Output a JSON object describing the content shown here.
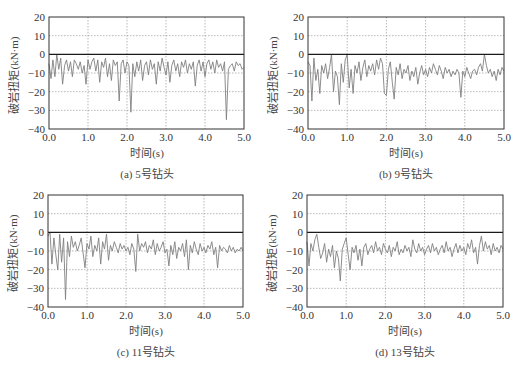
{
  "figure": {
    "caption": ""
  },
  "chart_data": [
    {
      "id": "a",
      "type": "line",
      "caption": "(a) 5号钻头",
      "xlabel": "时间(s)",
      "ylabel": "破岩扭矩(kN·m)",
      "xlim": [
        0.0,
        5.0
      ],
      "ylim": [
        -40,
        20
      ],
      "xticks": [
        "0.0",
        "1.0",
        "2.0",
        "3.0",
        "4.0",
        "5.0"
      ],
      "yticks": [
        "20",
        "10",
        "0",
        "-10",
        "-20",
        "-30",
        "-40"
      ],
      "grid": true,
      "zero_line": true,
      "line_color": "#808080",
      "frame": {
        "left": 49,
        "top": 17,
        "right": 244,
        "bottom": 129
      },
      "x": [
        0.0,
        0.05,
        0.1,
        0.15,
        0.2,
        0.25,
        0.3,
        0.35,
        0.4,
        0.45,
        0.5,
        0.55,
        0.6,
        0.65,
        0.7,
        0.75,
        0.8,
        0.85,
        0.9,
        0.95,
        1.0,
        1.05,
        1.1,
        1.15,
        1.2,
        1.25,
        1.3,
        1.35,
        1.4,
        1.45,
        1.5,
        1.55,
        1.6,
        1.65,
        1.7,
        1.75,
        1.8,
        1.85,
        1.9,
        1.95,
        2.0,
        2.05,
        2.1,
        2.15,
        2.2,
        2.25,
        2.3,
        2.35,
        2.4,
        2.45,
        2.5,
        2.55,
        2.6,
        2.65,
        2.7,
        2.75,
        2.8,
        2.85,
        2.9,
        2.95,
        3.0,
        3.05,
        3.1,
        3.15,
        3.2,
        3.25,
        3.3,
        3.35,
        3.4,
        3.45,
        3.5,
        3.55,
        3.6,
        3.65,
        3.7,
        3.75,
        3.8,
        3.85,
        3.9,
        3.95,
        4.0,
        4.05,
        4.1,
        4.15,
        4.2,
        4.25,
        4.3,
        4.35,
        4.4,
        4.45,
        4.5,
        4.55,
        4.6,
        4.65,
        4.7,
        4.75,
        4.8,
        4.85,
        4.9,
        4.95,
        5.0
      ],
      "values": [
        -5,
        -13,
        -3,
        -12,
        0,
        -8,
        -2,
        -16,
        -6,
        -3,
        -9,
        -4,
        -12,
        -3,
        -5,
        -8,
        -4,
        -10,
        -6,
        -16,
        -3,
        -8,
        -4,
        -2,
        -9,
        -3,
        -15,
        -4,
        -7,
        -2,
        -12,
        -5,
        -14,
        -3,
        -6,
        -4,
        -25,
        -5,
        -3,
        -10,
        -4,
        -6,
        -31,
        -5,
        -12,
        -4,
        -9,
        -3,
        -14,
        -6,
        -4,
        -11,
        -3,
        -8,
        -5,
        -16,
        -4,
        -9,
        -2,
        -7,
        -11,
        -4,
        -15,
        -6,
        -3,
        -9,
        -5,
        -12,
        -4,
        -7,
        -3,
        -10,
        -5,
        -8,
        -4,
        -17,
        -6,
        -3,
        -9,
        -4,
        -12,
        -5,
        -3,
        -8,
        -4,
        -10,
        -3,
        -7,
        -5,
        -9,
        -4,
        -35,
        -8,
        -6,
        -5,
        -9,
        -4,
        -6,
        -5,
        -8,
        -7
      ]
    },
    {
      "id": "b",
      "type": "line",
      "caption": "(b) 9号钻头",
      "xlabel": "时间(s)",
      "ylabel": "破岩扭矩(kN·m)",
      "xlim": [
        0.0,
        5.0
      ],
      "ylim": [
        -40,
        20
      ],
      "xticks": [
        "0.0",
        "1.0",
        "2.0",
        "3.0",
        "4.0",
        "5.0"
      ],
      "yticks": [
        "20",
        "10",
        "0",
        "-10",
        "-20",
        "-30",
        "-40"
      ],
      "grid": true,
      "zero_line": true,
      "line_color": "#808080",
      "frame": {
        "left": 308,
        "top": 17,
        "right": 504,
        "bottom": 129
      },
      "x": [
        0.0,
        0.05,
        0.1,
        0.15,
        0.2,
        0.25,
        0.3,
        0.35,
        0.4,
        0.45,
        0.5,
        0.55,
        0.6,
        0.65,
        0.7,
        0.75,
        0.8,
        0.85,
        0.9,
        0.95,
        1.0,
        1.05,
        1.1,
        1.15,
        1.2,
        1.25,
        1.3,
        1.35,
        1.4,
        1.45,
        1.5,
        1.55,
        1.6,
        1.65,
        1.7,
        1.75,
        1.8,
        1.85,
        1.9,
        1.95,
        2.0,
        2.05,
        2.1,
        2.15,
        2.2,
        2.25,
        2.3,
        2.35,
        2.4,
        2.45,
        2.5,
        2.55,
        2.6,
        2.65,
        2.7,
        2.75,
        2.8,
        2.85,
        2.9,
        2.95,
        3.0,
        3.05,
        3.1,
        3.15,
        3.2,
        3.25,
        3.3,
        3.35,
        3.4,
        3.45,
        3.5,
        3.55,
        3.6,
        3.65,
        3.7,
        3.75,
        3.8,
        3.85,
        3.9,
        3.95,
        4.0,
        4.05,
        4.1,
        4.15,
        4.2,
        4.25,
        4.3,
        4.35,
        4.4,
        4.45,
        4.5,
        4.55,
        4.6,
        4.65,
        4.7,
        4.75,
        4.8,
        4.85,
        4.9,
        4.95,
        5.0
      ],
      "values": [
        -4,
        -6,
        -25,
        -2,
        -14,
        -8,
        -21,
        -6,
        -10,
        -5,
        -13,
        -7,
        0,
        -20,
        -9,
        -12,
        -27,
        -5,
        -15,
        -3,
        0,
        -18,
        -8,
        -21,
        -6,
        -10,
        -4,
        -14,
        -7,
        -3,
        -12,
        -6,
        -9,
        -5,
        -11,
        -3,
        -8,
        -2,
        -5,
        -21,
        -22,
        -8,
        -4,
        -15,
        -24,
        -7,
        -11,
        -5,
        -13,
        -8,
        -10,
        -6,
        -14,
        -9,
        -12,
        -7,
        -16,
        -10,
        -6,
        -11,
        -8,
        -12,
        -7,
        -10,
        -5,
        -8,
        -11,
        -6,
        -9,
        -13,
        -7,
        -10,
        -8,
        -12,
        -9,
        -11,
        -8,
        -10,
        -23,
        -9,
        -12,
        -7,
        -10,
        -13,
        -9,
        -8,
        -11,
        -7,
        -5,
        -9,
        0,
        -6,
        -10,
        -8,
        -12,
        -9,
        -14,
        -8,
        -11,
        -7,
        -9
      ]
    },
    {
      "id": "c",
      "type": "line",
      "caption": "(c) 11号钻头",
      "xlabel": "时间(s)",
      "ylabel": "破岩扭矩(kN·m)",
      "xlim": [
        0.0,
        5.0
      ],
      "ylim": [
        -40,
        20
      ],
      "xticks": [
        "0.0",
        "1.0",
        "2.0",
        "3.0",
        "4.0",
        "5.0"
      ],
      "yticks": [
        "20",
        "10",
        "0",
        "-10",
        "-20",
        "-30",
        "-40"
      ],
      "grid": true,
      "zero_line": true,
      "line_color": "#808080",
      "frame": {
        "left": 48,
        "top": 195,
        "right": 243,
        "bottom": 307
      },
      "x": [
        0.0,
        0.05,
        0.1,
        0.15,
        0.2,
        0.25,
        0.3,
        0.35,
        0.4,
        0.45,
        0.5,
        0.55,
        0.6,
        0.65,
        0.7,
        0.75,
        0.8,
        0.85,
        0.9,
        0.95,
        1.0,
        1.05,
        1.1,
        1.15,
        1.2,
        1.25,
        1.3,
        1.35,
        1.4,
        1.45,
        1.5,
        1.55,
        1.6,
        1.65,
        1.7,
        1.75,
        1.8,
        1.85,
        1.9,
        1.95,
        2.0,
        2.05,
        2.1,
        2.15,
        2.2,
        2.25,
        2.3,
        2.35,
        2.4,
        2.45,
        2.5,
        2.55,
        2.6,
        2.65,
        2.7,
        2.75,
        2.8,
        2.85,
        2.9,
        2.95,
        3.0,
        3.05,
        3.1,
        3.15,
        3.2,
        3.25,
        3.3,
        3.35,
        3.4,
        3.45,
        3.5,
        3.55,
        3.6,
        3.65,
        3.7,
        3.75,
        3.8,
        3.85,
        3.9,
        3.95,
        4.0,
        4.05,
        4.1,
        4.15,
        4.2,
        4.25,
        4.3,
        4.35,
        4.4,
        4.45,
        4.5,
        4.55,
        4.6,
        4.65,
        4.7,
        4.75,
        4.8,
        4.85,
        4.9,
        4.95,
        5.0
      ],
      "values": [
        -2,
        0,
        -17,
        -3,
        -12,
        -20,
        -1,
        -16,
        -3,
        -36,
        -5,
        -13,
        -2,
        -8,
        -5,
        -10,
        -7,
        -3,
        -11,
        -19,
        -6,
        -9,
        -2,
        -13,
        -7,
        -10,
        -3,
        -17,
        -5,
        -9,
        -1,
        -15,
        -7,
        -10,
        -5,
        -8,
        -11,
        -6,
        -9,
        -7,
        -10,
        -8,
        -12,
        -6,
        -9,
        -21,
        -1,
        -10,
        -6,
        -8,
        -5,
        -11,
        -7,
        -9,
        -4,
        -12,
        -6,
        -10,
        -8,
        -5,
        -11,
        -9,
        -18,
        -7,
        -12,
        -5,
        -14,
        -8,
        -10,
        -6,
        -13,
        -4,
        -20,
        -7,
        -11,
        -5,
        -9,
        -12,
        -6,
        -10,
        -8,
        -11,
        -7,
        -9,
        -5,
        -12,
        -8,
        -19,
        -7,
        -10,
        -8,
        -9,
        -11,
        -7,
        -10,
        -8,
        -11,
        -9,
        -10,
        -8,
        -10
      ]
    },
    {
      "id": "d",
      "type": "line",
      "caption": "(d) 13号钻头",
      "xlabel": "时间(s)",
      "ylabel": "破岩扭矩(kN·m)",
      "xlim": [
        0.0,
        5.0
      ],
      "ylim": [
        -40,
        20
      ],
      "xticks": [
        "0.0",
        "1.0",
        "2.0",
        "3.0",
        "4.0",
        "5.0"
      ],
      "yticks": [
        "20",
        "10",
        "0",
        "-10",
        "-20",
        "-30",
        "-40"
      ],
      "grid": true,
      "zero_line": true,
      "line_color": "#808080",
      "frame": {
        "left": 307,
        "top": 195,
        "right": 503,
        "bottom": 307
      },
      "x": [
        0.0,
        0.05,
        0.1,
        0.15,
        0.2,
        0.25,
        0.3,
        0.35,
        0.4,
        0.45,
        0.5,
        0.55,
        0.6,
        0.65,
        0.7,
        0.75,
        0.8,
        0.85,
        0.9,
        0.95,
        1.0,
        1.05,
        1.1,
        1.15,
        1.2,
        1.25,
        1.3,
        1.35,
        1.4,
        1.45,
        1.5,
        1.55,
        1.6,
        1.65,
        1.7,
        1.75,
        1.8,
        1.85,
        1.9,
        1.95,
        2.0,
        2.05,
        2.1,
        2.15,
        2.2,
        2.25,
        2.3,
        2.35,
        2.4,
        2.45,
        2.5,
        2.55,
        2.6,
        2.65,
        2.7,
        2.75,
        2.8,
        2.85,
        2.9,
        2.95,
        3.0,
        3.05,
        3.1,
        3.15,
        3.2,
        3.25,
        3.3,
        3.35,
        3.4,
        3.45,
        3.5,
        3.55,
        3.6,
        3.65,
        3.7,
        3.75,
        3.8,
        3.85,
        3.9,
        3.95,
        4.0,
        4.05,
        4.1,
        4.15,
        4.2,
        4.25,
        4.3,
        4.35,
        4.4,
        4.45,
        4.5,
        4.55,
        4.6,
        4.65,
        4.7,
        4.75,
        4.8,
        4.85,
        4.9,
        4.95,
        5.0
      ],
      "values": [
        -5,
        -18,
        -6,
        -10,
        -4,
        -1,
        -8,
        -14,
        -11,
        -6,
        -16,
        -9,
        -13,
        -7,
        -19,
        -10,
        -14,
        -26,
        -9,
        -6,
        -3,
        -12,
        -20,
        -8,
        -11,
        -7,
        -15,
        -9,
        -18,
        -8,
        -6,
        -12,
        -9,
        -7,
        -11,
        -5,
        -10,
        -8,
        -12,
        -6,
        -9,
        -11,
        -7,
        -13,
        -8,
        -10,
        -5,
        -12,
        -9,
        -11,
        -7,
        -10,
        -8,
        -13,
        -4,
        -9,
        -11,
        -6,
        -10,
        -8,
        -12,
        -9,
        -7,
        -11,
        -6,
        -10,
        -8,
        -12,
        -9,
        -7,
        -11,
        -5,
        -10,
        -8,
        -13,
        -9,
        -6,
        -11,
        -7,
        -10,
        -8,
        -12,
        -6,
        -9,
        -4,
        -11,
        -8,
        -17,
        -7,
        -2,
        -10,
        -5,
        -9,
        -7,
        -12,
        -6,
        -10,
        -8,
        -11,
        -7,
        -9
      ]
    }
  ]
}
